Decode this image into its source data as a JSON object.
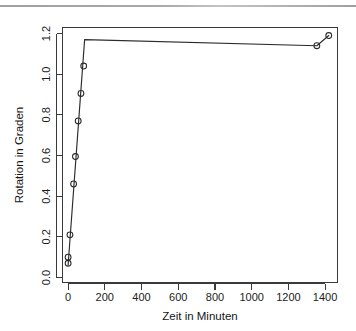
{
  "figure": {
    "background_color": "#ffffff",
    "ink_color": "#2b2b2b",
    "scan_artifact": "top-edge-scan-line"
  },
  "chart_data": {
    "type": "line",
    "title": "",
    "subtitle": "",
    "xlabel": "Zeit in Minuten",
    "ylabel": "Rotation in Graden",
    "xlim": [
      -40,
      1440
    ],
    "ylim": [
      0.0,
      1.24
    ],
    "xticks": [
      0,
      200,
      400,
      600,
      800,
      1000,
      1200,
      1400
    ],
    "xticklabels": [
      "0",
      "200",
      "400",
      "600",
      "800",
      "1000",
      "1200",
      "1400"
    ],
    "yticks": [
      0.0,
      0.2,
      0.4,
      0.6,
      0.8,
      1.0,
      1.2
    ],
    "yticklabels": [
      "0.0",
      "0.2",
      "0.4",
      "0.6",
      "0.8",
      "1.0",
      "1.2"
    ],
    "grid": false,
    "legend": null,
    "legend_position": "none",
    "marker": "open-circle",
    "series": [
      {
        "name": "Rotation",
        "x": [
          0,
          0,
          10,
          30,
          40,
          55,
          70,
          85,
          1355,
          1420
        ],
        "y": [
          0.07,
          0.1,
          0.21,
          0.46,
          0.595,
          0.77,
          0.905,
          1.04,
          1.14,
          1.19
        ]
      }
    ],
    "fitted_line": {
      "name": "Verbindungslinie",
      "x": [
        0,
        90,
        1355,
        1420
      ],
      "y": [
        0.06,
        1.17,
        1.14,
        1.19
      ]
    }
  }
}
